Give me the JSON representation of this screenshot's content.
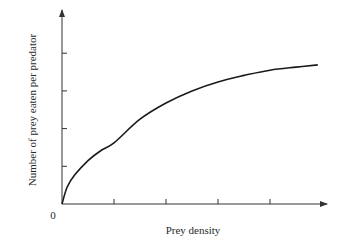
{
  "chart_data": {
    "type": "line",
    "title": "",
    "xlabel": "Prey density",
    "ylabel": "Number of prey eaten per predator",
    "origin_label": "0",
    "x_ticks": 4,
    "y_ticks": 4,
    "tick_labels_shown": false,
    "grid": false,
    "legend": null,
    "xlim": [
      0,
      5.1
    ],
    "ylim": [
      0,
      5.3
    ],
    "series": [
      {
        "name": "Functional response (Type II)",
        "color": "#1a1a1a",
        "x": [
          0,
          0.1,
          0.25,
          0.5,
          0.75,
          1,
          1.5,
          2,
          2.5,
          3,
          3.5,
          4,
          4.5,
          4.92
        ],
        "y": [
          0,
          0.45,
          0.78,
          1.15,
          1.42,
          1.62,
          2.25,
          2.68,
          3.0,
          3.24,
          3.41,
          3.55,
          3.63,
          3.69
        ]
      }
    ]
  },
  "colors": {
    "axis": "#333333",
    "curve": "#1a1a1a",
    "background": "#ffffff"
  }
}
